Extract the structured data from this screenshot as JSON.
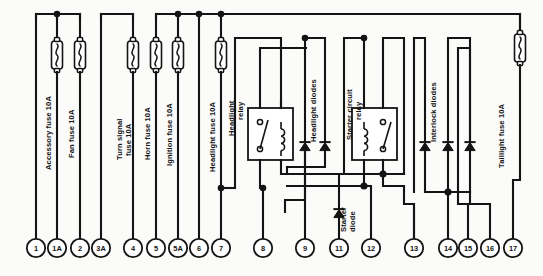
{
  "diagram": {
    "type": "electrical-schematic",
    "line_color": "#141414",
    "background_color": "#fbfbfa"
  },
  "components": {
    "fuses": [
      {
        "id": "accessory",
        "label": "Accessory fuse 10A",
        "rating": "10A",
        "x": 57
      },
      {
        "id": "fan",
        "label": "Fan fuse 10A",
        "rating": "10A",
        "x": 80
      },
      {
        "id": "turn-signal",
        "label": "Turn signal\nfuse 10A",
        "label_line1": "Turn signal",
        "label_line2": "fuse 10A",
        "rating": "10A",
        "x": 133
      },
      {
        "id": "horn",
        "label": "Horn fuse 10A",
        "rating": "10A",
        "x": 156
      },
      {
        "id": "ignition",
        "label": "Ignition fuse 10A",
        "rating": "10A",
        "x": 179
      },
      {
        "id": "headlight",
        "label": "Headlight fuse 10A",
        "rating": "10A",
        "x": 221
      },
      {
        "id": "taillight",
        "label": "Taillight fuse 10A",
        "rating": "10A",
        "x": 520
      }
    ],
    "relays": [
      {
        "id": "headlight-relay",
        "label_line1": "Headlight",
        "label_line2": "relay",
        "label": "Headlight relay"
      },
      {
        "id": "starter-circuit-relay",
        "label_line1": "Starter circuit",
        "label_line2": "relay",
        "label": "Starter circuit relay"
      }
    ],
    "diode_groups": [
      {
        "id": "headlight-diodes",
        "label": "Headlight diodes",
        "count": 2
      },
      {
        "id": "starter-diode",
        "label_line1": "Starter",
        "label_line2": "diode",
        "label": "Starter diode",
        "count": 1
      },
      {
        "id": "interlock-diodes",
        "label": "Interlock diodes",
        "count": 3
      }
    ]
  },
  "terminals": [
    {
      "id": "t1",
      "label": "1",
      "x": 36
    },
    {
      "id": "t1a",
      "label": "1A",
      "x": 57
    },
    {
      "id": "t2",
      "label": "2",
      "x": 80
    },
    {
      "id": "t3a",
      "label": "3A",
      "x": 101
    },
    {
      "id": "t4",
      "label": "4",
      "x": 133
    },
    {
      "id": "t5",
      "label": "5",
      "x": 156
    },
    {
      "id": "t5a",
      "label": "5A",
      "x": 178
    },
    {
      "id": "t6",
      "label": "6",
      "x": 199
    },
    {
      "id": "t7",
      "label": "7",
      "x": 221
    },
    {
      "id": "t8",
      "label": "8",
      "x": 263
    },
    {
      "id": "t9",
      "label": "9",
      "x": 305
    },
    {
      "id": "t11",
      "label": "11",
      "x": 339
    },
    {
      "id": "t12",
      "label": "12",
      "x": 371
    },
    {
      "id": "t13",
      "label": "13",
      "x": 414
    },
    {
      "id": "t14",
      "label": "14",
      "x": 448
    },
    {
      "id": "t15",
      "label": "15",
      "x": 468
    },
    {
      "id": "t16",
      "label": "16",
      "x": 490
    },
    {
      "id": "t17",
      "label": "17",
      "x": 513
    }
  ],
  "labels": {
    "accessory_fuse": "Accessory fuse 10A",
    "fan_fuse": "Fan fuse 10A",
    "turn_signal_fuse_l1": "Turn signal",
    "turn_signal_fuse_l2": "fuse 10A",
    "horn_fuse": "Horn fuse 10A",
    "ignition_fuse": "Ignition fuse 10A",
    "headlight_fuse": "Headlight fuse 10A",
    "headlight_relay_l1": "Headlight",
    "headlight_relay_l2": "relay",
    "headlight_diodes": "Headlight diodes",
    "starter_circuit_relay_l1": "Starter circuit",
    "starter_circuit_relay_l2": "relay",
    "starter_diode_l1": "Starter",
    "starter_diode_l2": "diode",
    "interlock_diodes": "Interlock diodes",
    "taillight_fuse": "Taillight fuse 10A"
  }
}
